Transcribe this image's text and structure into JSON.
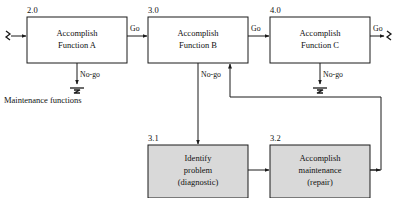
{
  "diagram": {
    "caption": "Maintenance functions",
    "colors": {
      "line": "#1a1a1a",
      "text": "#111111",
      "node_fill_plain": "#ffffff",
      "node_fill_shaded": "#d9d9d9",
      "background": "#ffffff"
    },
    "nodes": [
      {
        "id": "2.0",
        "number": "2.0",
        "line1": "Accomplish",
        "line2": "Function A",
        "line3": "",
        "shaded": false
      },
      {
        "id": "3.0",
        "number": "3.0",
        "line1": "Accomplish",
        "line2": "Function B",
        "line3": "",
        "shaded": false
      },
      {
        "id": "4.0",
        "number": "4.0",
        "line1": "Accomplish",
        "line2": "Function C",
        "line3": "",
        "shaded": false
      },
      {
        "id": "3.1",
        "number": "3.1",
        "line1": "Identify",
        "line2": "problem",
        "line3": "(diagnostic)",
        "shaded": true
      },
      {
        "id": "3.2",
        "number": "3.2",
        "line1": "Accomplish",
        "line2": "maintenance",
        "line3": "(repair)",
        "shaded": true
      }
    ],
    "edges": [
      {
        "id": "input-to-2",
        "label": "",
        "from": "input-terminator",
        "to": "2.0"
      },
      {
        "id": "go-2-to-3",
        "label": "Go",
        "from": "2.0",
        "to": "3.0"
      },
      {
        "id": "go-3-to-4",
        "label": "Go",
        "from": "3.0",
        "to": "4.0"
      },
      {
        "id": "go-4-out",
        "label": "Go",
        "from": "4.0",
        "to": "output-terminator"
      },
      {
        "id": "nogo-2",
        "label": "No-go",
        "from": "2.0",
        "to": "stop-terminator"
      },
      {
        "id": "nogo-3",
        "label": "No-go",
        "from": "3.0",
        "to": "3.1"
      },
      {
        "id": "nogo-4",
        "label": "No-go",
        "from": "4.0",
        "to": "stop-terminator"
      },
      {
        "id": "edge-31-to-32",
        "label": "",
        "from": "3.1",
        "to": "3.2"
      },
      {
        "id": "return-32-to-3",
        "label": "",
        "from": "3.2",
        "to": "3.0"
      }
    ]
  }
}
